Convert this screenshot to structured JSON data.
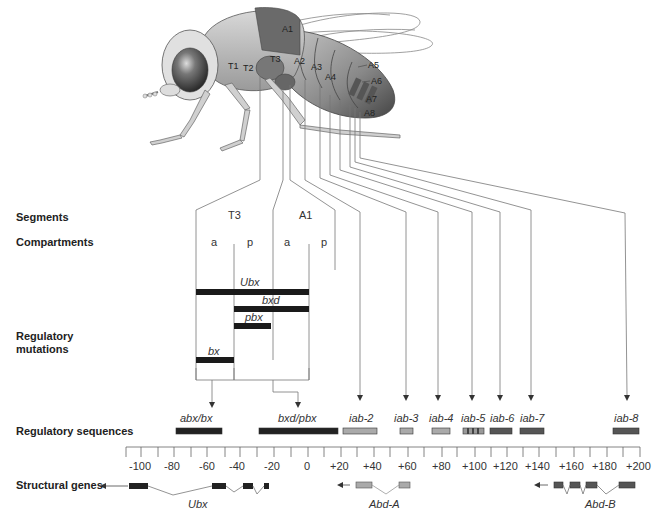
{
  "figure": {
    "row_labels": {
      "segments": "Segments",
      "compartments": "Compartments",
      "regulatory_mutations_1": "Regulatory",
      "regulatory_mutations_2": "mutations",
      "regulatory_sequences": "Regulatory sequences",
      "structural_genes": "Structural genes"
    },
    "fly_labels": {
      "t1": "T1",
      "t2": "T2",
      "t3": "T3",
      "a1": "A1",
      "a2": "A2",
      "a3": "A3",
      "a4": "A4",
      "a5": "A5",
      "a6": "A6",
      "a7": "A7",
      "a8": "A8"
    },
    "segments": [
      {
        "label": "T3"
      },
      {
        "label": "A1"
      }
    ],
    "compartments": [
      "a",
      "p",
      "a",
      "p"
    ],
    "mutations": [
      {
        "label": "Ubx"
      },
      {
        "label": "bxd"
      },
      {
        "label": "pbx"
      },
      {
        "label": "bx"
      }
    ],
    "regulatory_sequences": [
      {
        "label": "abx/bx",
        "start": -80,
        "end": -52,
        "shade": "#222222"
      },
      {
        "label": "bxd/pbx",
        "start": -30,
        "end": 18,
        "shade": "#222222"
      },
      {
        "label": "iab-2",
        "start": 22,
        "end": 43,
        "shade": "#aaaaaa"
      },
      {
        "label": "iab-3",
        "start": 55,
        "end": 63,
        "shade": "#aaaaaa"
      },
      {
        "label": "iab-4",
        "start": 74,
        "end": 85,
        "shade": "#aaaaaa"
      },
      {
        "label": "iab-5",
        "start": 95,
        "end": 108,
        "shade": "#888888"
      },
      {
        "label": "iab-6",
        "start": 112,
        "end": 125,
        "shade": "#555555"
      },
      {
        "label": "iab-7",
        "start": 131,
        "end": 145,
        "shade": "#555555"
      },
      {
        "label": "iab-8",
        "start": 189,
        "end": 201,
        "shade": "#555555"
      }
    ],
    "axis": {
      "ticks": [
        "-100",
        "-80",
        "-60",
        "-40",
        "-20",
        "0",
        "+20",
        "+40",
        "+60",
        "+80",
        "+100",
        "+120",
        "+140",
        "+160",
        "+180",
        "+200"
      ]
    },
    "structural_genes": [
      {
        "label": "Ubx"
      },
      {
        "label": "Abd-A"
      },
      {
        "label": "Abd-B"
      }
    ]
  }
}
